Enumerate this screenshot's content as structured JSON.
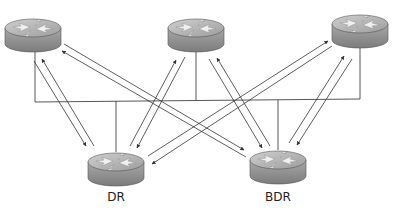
{
  "diagram": {
    "colors": {
      "line": "#444444",
      "router_top": "#b5b5b5",
      "router_side": "#8a8a8a",
      "router_arrows": "#eeeeee"
    },
    "routers": [
      {
        "id": "r1",
        "label": "",
        "role": "DROther"
      },
      {
        "id": "r2",
        "label": "",
        "role": "DROther"
      },
      {
        "id": "r3",
        "label": "",
        "role": "DROther"
      },
      {
        "id": "dr",
        "label": "DR",
        "role": "DR"
      },
      {
        "id": "bdr",
        "label": "BDR",
        "role": "BDR"
      }
    ],
    "labels": {
      "dr": "DR",
      "bdr": "BDR"
    }
  }
}
